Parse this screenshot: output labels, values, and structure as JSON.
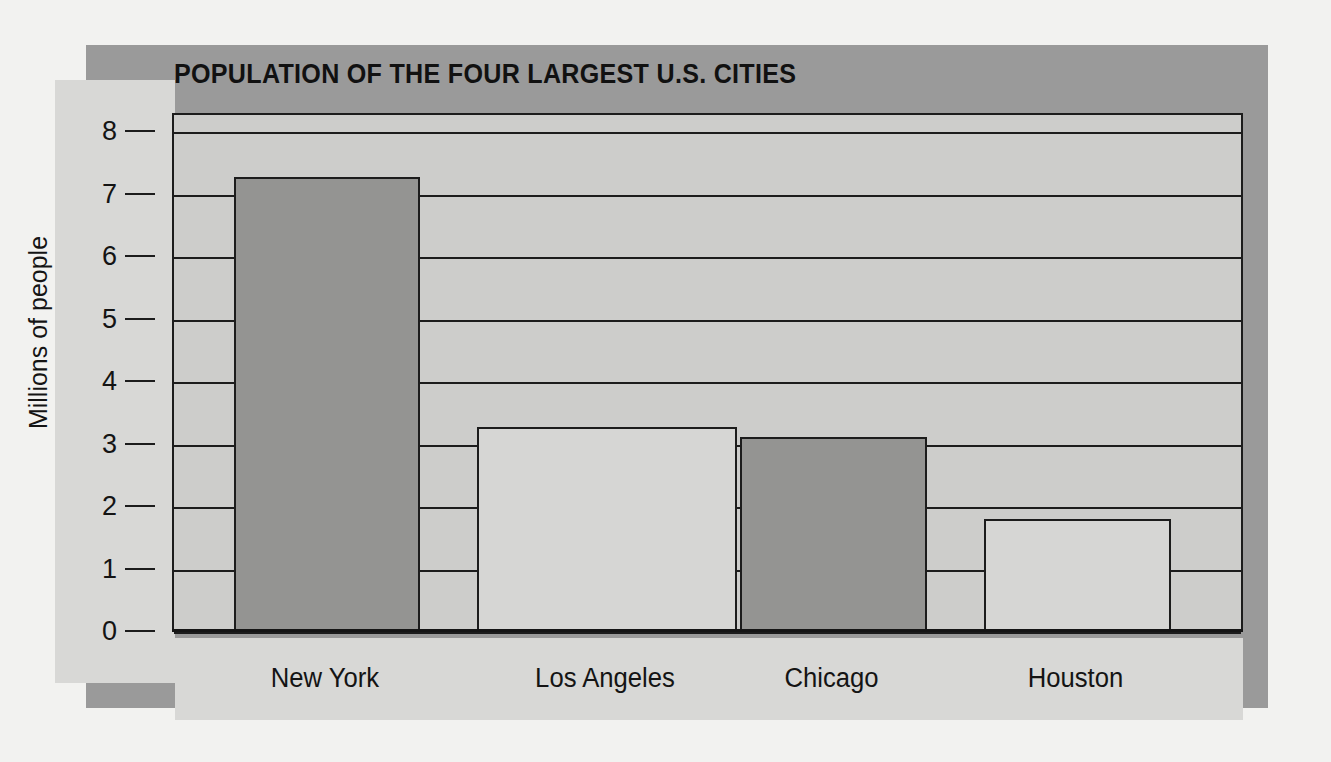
{
  "chart_data": {
    "type": "bar",
    "title": "POPULATION OF THE FOUR LARGEST U.S. CITIES",
    "xlabel": "",
    "ylabel": "Millions of people",
    "categories": [
      "New York",
      "Los Angeles",
      "Chicago",
      "Houston"
    ],
    "values": [
      7.27,
      3.27,
      3.1,
      1.8
    ],
    "ylim": [
      0,
      8.3
    ],
    "yticks": [
      0,
      1,
      2,
      3,
      4,
      5,
      6,
      7,
      8
    ],
    "ytick_labels": [
      "0",
      "1",
      "2",
      "3",
      "4",
      "5",
      "6",
      "7",
      "8"
    ],
    "grid": true,
    "legend": "none",
    "bar_colors": [
      "#949492",
      "#d6d6d4",
      "#949492",
      "#d6d6d4"
    ],
    "bar_edge_color": "#1c1c1c",
    "plot_background": "#cdcdcb",
    "panel_background": "#d8d8d6",
    "shadow_color": "#9a9a9a",
    "page_background": "#f2f2f0"
  }
}
